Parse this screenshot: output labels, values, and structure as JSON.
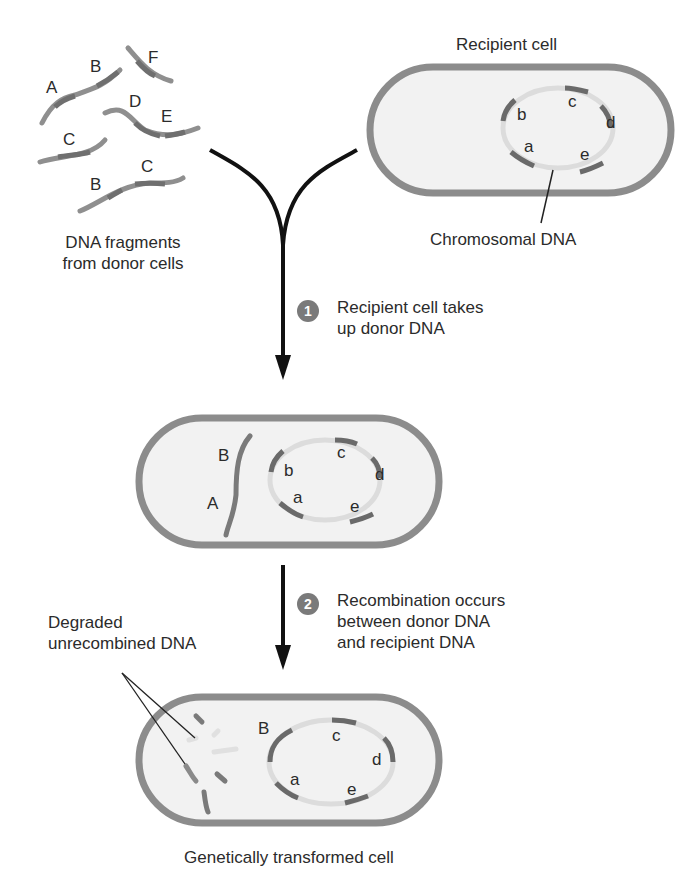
{
  "labels": {
    "recipient_cell": "Recipient cell",
    "chromosomal_dna": "Chromosomal DNA",
    "dna_fragments": "DNA fragments\nfrom donor cells",
    "dna_fragments_l1": "DNA fragments",
    "dna_fragments_l2": "from donor cells",
    "degraded_l1": "Degraded",
    "degraded_l2": "unrecombined DNA",
    "transformed_cell": "Genetically transformed cell"
  },
  "steps": [
    {
      "number": "1",
      "line1": "Recipient cell takes",
      "line2": "up donor DNA"
    },
    {
      "number": "2",
      "line1": "Recombination occurs",
      "line2": "between donor DNA",
      "line3": "and recipient DNA"
    }
  ],
  "fragments": {
    "f1": [
      "A",
      "B"
    ],
    "f2": [
      "F"
    ],
    "f3": [
      "D",
      "E"
    ],
    "f4": [
      "C"
    ],
    "f5": [
      "B",
      "C"
    ]
  },
  "chromosome_genes": [
    "a",
    "b",
    "c",
    "d",
    "e"
  ],
  "cell2_fragment": [
    "B",
    "A"
  ],
  "cell3_recombined_gene": "B",
  "colors": {
    "cell_wall": "#8c8c8c",
    "cytoplasm": "#f1f1f1",
    "dna_light": "#d8d8d8",
    "gene_dark": "#6a6a6a",
    "arrow": "#111111",
    "step_badge": "#7a7a7a"
  }
}
